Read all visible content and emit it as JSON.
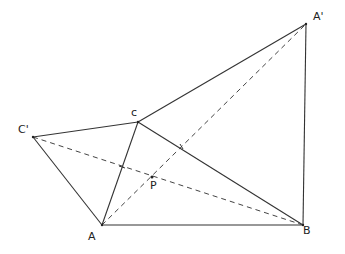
{
  "diagram": {
    "points": {
      "A": {
        "label": "A",
        "x": 102,
        "y": 225,
        "label_x": 88,
        "label_y": 231
      },
      "B": {
        "label": "B",
        "x": 303,
        "y": 225,
        "label_x": 303,
        "label_y": 225
      },
      "C": {
        "label": "c",
        "x": 138,
        "y": 122,
        "label_x": 131,
        "label_y": 107
      },
      "C'": {
        "label": "C'",
        "x": 33,
        "y": 137,
        "label_x": 18,
        "label_y": 124
      },
      "A'": {
        "label": "A'",
        "x": 306,
        "y": 24,
        "label_x": 313,
        "label_y": 11
      },
      "P": {
        "label": "P",
        "x": 152,
        "y": 177,
        "label_x": 150,
        "label_y": 180
      }
    },
    "solid_segments": [
      [
        "A",
        "B"
      ],
      [
        "B",
        "C"
      ],
      [
        "C",
        "A"
      ],
      [
        "C",
        "C'"
      ],
      [
        "C'",
        "A"
      ],
      [
        "C",
        "A'"
      ],
      [
        "A'",
        "B"
      ]
    ],
    "dashed_segments": [
      [
        "A",
        "A'"
      ],
      [
        "C'",
        "B"
      ]
    ],
    "stroke_color": "#333333"
  }
}
